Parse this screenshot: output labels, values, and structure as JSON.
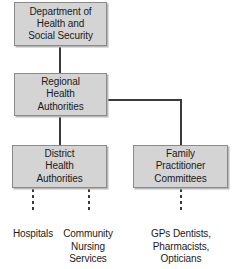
{
  "diagram": {
    "type": "organisational-hierarchy",
    "colors": {
      "node_fill": "#d4d4d4",
      "node_border": "#8a8a8a",
      "connector": "#3a3a3a",
      "text": "#1a1a1a",
      "background": "#ffffff"
    },
    "nodes": [
      {
        "id": "dhss",
        "label": "Department of\nHealth and\nSocial Security",
        "level": 1
      },
      {
        "id": "rha",
        "label": "Regional\nHealth\nAuthorities",
        "level": 2
      },
      {
        "id": "dha",
        "label": "District\nHealth\nAuthorities",
        "level": 3
      },
      {
        "id": "fpc",
        "label": "Family\nPractitioner\nCommittees",
        "level": 3
      }
    ],
    "leaves": [
      {
        "id": "hospitals",
        "label": "Hospitals",
        "parent": "dha"
      },
      {
        "id": "community-nursing",
        "label": "Community\nNursing\nServices",
        "parent": "dha"
      },
      {
        "id": "gps-dentists",
        "label": "GPs Dentists,\nPharmacists,\nOpticians",
        "parent": "fpc"
      }
    ],
    "connectors": [
      {
        "id": "dhss-to-rha",
        "style": "solid",
        "orientation": "vertical"
      },
      {
        "id": "rha-to-dha",
        "style": "solid",
        "orientation": "vertical"
      },
      {
        "id": "rha-to-fpc-horizontal",
        "style": "solid",
        "orientation": "horizontal"
      },
      {
        "id": "rha-to-fpc-vertical",
        "style": "solid",
        "orientation": "vertical"
      },
      {
        "id": "dha-to-hospitals",
        "style": "dashed",
        "orientation": "vertical"
      },
      {
        "id": "dha-to-community-nursing",
        "style": "dashed",
        "orientation": "vertical"
      },
      {
        "id": "fpc-to-gps-dentists",
        "style": "dashed",
        "orientation": "vertical"
      }
    ]
  }
}
